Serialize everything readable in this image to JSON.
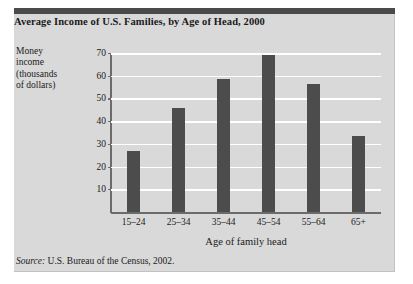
{
  "figure": {
    "title": "Average Income of U.S. Families, by Age of Head, 2000",
    "source_label": "Source:",
    "source_text": "U.S. Bureau of the Census, 2002.",
    "panel_color": "#d9d9d9",
    "rule_color": "#4a4a4a"
  },
  "y_caption_lines": [
    "Money",
    "income",
    "(thousands",
    "of dollars)"
  ],
  "chart_data": {
    "type": "bar",
    "title": "Average Income of U.S. Families, by Age of Head, 2000",
    "categories": [
      "15–24",
      "25–34",
      "35–44",
      "45–54",
      "55–64",
      "65+"
    ],
    "values": [
      27,
      46,
      58.5,
      69,
      56.5,
      33.5
    ],
    "xlabel": "Age of family head",
    "ylabel": "Money income (thousands of dollars)",
    "ylim": [
      0,
      70
    ],
    "yticks": [
      10,
      20,
      30,
      40,
      50,
      60,
      70
    ],
    "ytick_labels": [
      "10",
      "20",
      "30",
      "40",
      "50",
      "60",
      "70"
    ],
    "grid": true,
    "gridline_color": "#ffffff",
    "bar_color": "#4c4c4c",
    "legend": null,
    "source": "Source: U.S. Bureau of the Census, 2002."
  }
}
